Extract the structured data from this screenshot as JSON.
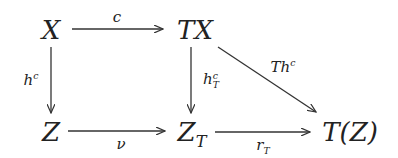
{
  "diagram": {
    "type": "commutative-diagram",
    "nodes": {
      "X": {
        "main": "X"
      },
      "TX": {
        "main": "TX"
      },
      "Z": {
        "main": "Z"
      },
      "ZT": {
        "main": "Z",
        "sub": "T"
      },
      "TZ": {
        "main": "T(Z)"
      }
    },
    "arrows": {
      "c": {
        "from": "X",
        "to": "TX",
        "label": "c"
      },
      "hc": {
        "from": "X",
        "to": "Z",
        "label_main": "h",
        "label_sup": "c"
      },
      "hcT": {
        "from": "TX",
        "to": "Z_T",
        "label_main": "h",
        "label_sup": "c",
        "label_sub": "T"
      },
      "Thc": {
        "from": "TX",
        "to": "T(Z)",
        "label_main": "Th",
        "label_sup": "c"
      },
      "nu": {
        "from": "Z",
        "to": "Z_T",
        "label": "ν"
      },
      "rT": {
        "from": "Z_T",
        "to": "T(Z)",
        "label_main": "r",
        "label_sub": "T"
      }
    },
    "colors": {
      "ink": "#222222",
      "background": "#ffffff"
    }
  }
}
